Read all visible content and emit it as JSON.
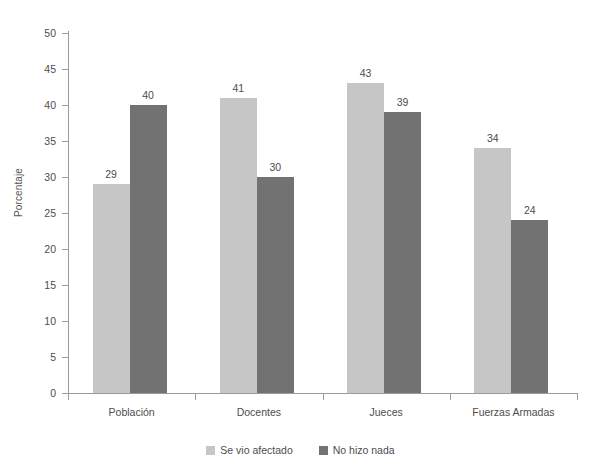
{
  "chart_data": {
    "type": "bar",
    "title": "",
    "xlabel": "",
    "ylabel": "Porcentaje",
    "ylim": [
      0,
      50
    ],
    "yticks": [
      0,
      5,
      10,
      15,
      20,
      25,
      30,
      35,
      40,
      45,
      50
    ],
    "grid": false,
    "legend_position": "bottom",
    "categories": [
      "Población",
      "Docentes",
      "Jueces",
      "Fuerzas Armadas"
    ],
    "series": [
      {
        "name": "Se vio afectado",
        "color": "#c6c6c6",
        "values": [
          29,
          41,
          43,
          34
        ]
      },
      {
        "name": "No hizo nada",
        "color": "#727272",
        "values": [
          40,
          30,
          39,
          24
        ]
      }
    ]
  }
}
